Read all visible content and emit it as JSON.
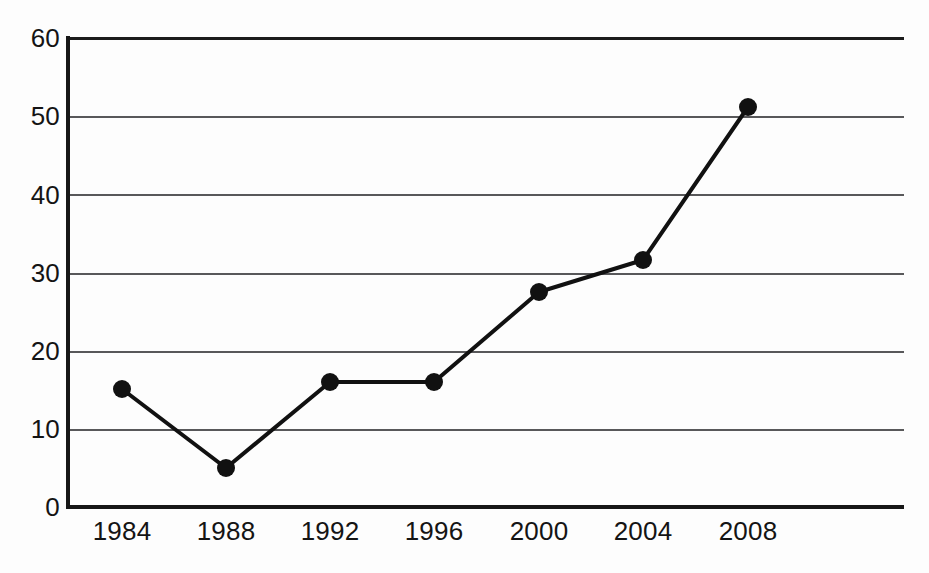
{
  "chart_data": {
    "type": "line",
    "title": "",
    "subtitle": "",
    "xlabel": "",
    "ylabel": "",
    "categories": [
      "1984",
      "1988",
      "1992",
      "1996",
      "2000",
      "2004",
      "2008"
    ],
    "x": [
      1984,
      1988,
      1992,
      1996,
      2000,
      2004,
      2008
    ],
    "values": [
      15,
      5,
      16,
      16,
      27.5,
      31.5,
      51
    ],
    "series": [
      {
        "name": "",
        "values": [
          15,
          5,
          16,
          16,
          27.5,
          31.5,
          51
        ],
        "marker": "filled-circle",
        "color": "#111111"
      }
    ],
    "ylim": [
      0,
      60
    ],
    "yticks": [
      0,
      10,
      20,
      30,
      40,
      50,
      60
    ],
    "ytick_labels": [
      "0",
      "10",
      "20",
      "30",
      "40",
      "50",
      "60"
    ],
    "xtick_labels": [
      "1984",
      "1988",
      "1992",
      "1996",
      "2000",
      "2004",
      "2008"
    ],
    "grid": "horizontal",
    "grid_color": "#58585a",
    "axis_color": "#171717",
    "legend": "none",
    "legend_position": "none",
    "annotations": [],
    "background_color": "#fdfdfd",
    "line_color": "#111111",
    "marker_color": "#111111",
    "line_width": 4,
    "marker_radius": 9
  },
  "axes": {
    "y_ticks": [
      {
        "label": "60",
        "value": 60,
        "y": 38
      },
      {
        "label": "50",
        "value": 50,
        "y": 116
      },
      {
        "label": "40",
        "value": 40,
        "y": 195
      },
      {
        "label": "30",
        "value": 30,
        "y": 273
      },
      {
        "label": "20",
        "value": 20,
        "y": 351
      },
      {
        "label": "10",
        "value": 10,
        "y": 429
      },
      {
        "label": "0",
        "value": 0,
        "y": 507
      }
    ],
    "x_ticks": [
      {
        "label": "1984",
        "value": 1984,
        "x": 122
      },
      {
        "label": "1988",
        "value": 1988,
        "x": 226
      },
      {
        "label": "1992",
        "value": 1992,
        "x": 330
      },
      {
        "label": "1996",
        "value": 1996,
        "x": 434
      },
      {
        "label": "2000",
        "value": 2000,
        "x": 539
      },
      {
        "label": "2004",
        "value": 2004,
        "x": 643
      },
      {
        "label": "2008",
        "value": 2008,
        "x": 748
      }
    ]
  },
  "points": [
    {
      "label": "1984",
      "value": 15,
      "cx": 122,
      "cy": 389
    },
    {
      "label": "1988",
      "value": 5,
      "cx": 226,
      "cy": 468
    },
    {
      "label": "1992",
      "value": 16,
      "cx": 330,
      "cy": 382
    },
    {
      "label": "1996",
      "value": 16,
      "cx": 434,
      "cy": 382
    },
    {
      "label": "2000",
      "value": 27.5,
      "cx": 539,
      "cy": 292
    },
    {
      "label": "2004",
      "value": 31.5,
      "cx": 643,
      "cy": 260
    },
    {
      "label": "2008",
      "value": 51,
      "cx": 748,
      "cy": 107
    }
  ]
}
